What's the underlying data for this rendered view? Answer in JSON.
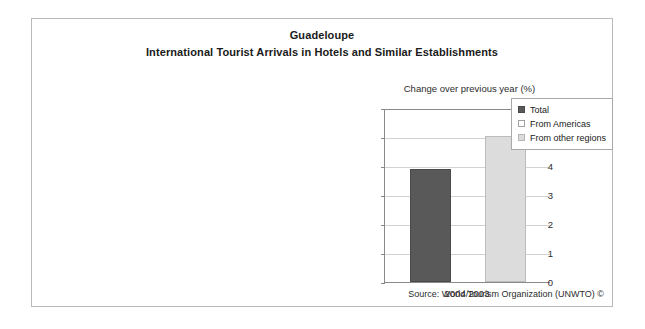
{
  "figure": {
    "title": "Guadeloupe",
    "subtitle": "International Tourist Arrivals in Hotels and Similar Establishments",
    "axis_note": "Change over previous year (%)",
    "source": "Source: World Tourism Organization (UNWTO) ©"
  },
  "colors": {
    "total": "#595959",
    "from_americas": "#ffffff",
    "from_other_regions": "#dcdcdc",
    "frame": "#b9b9b9",
    "axis": "#8a8a8a",
    "gridline": "#d2d2d2"
  },
  "legend": {
    "position": "top-right",
    "items": [
      {
        "label": "Total",
        "swatch": "total"
      },
      {
        "label": "From Americas",
        "swatch": "from_americas"
      },
      {
        "label": "From other regions",
        "swatch": "from_other_regions"
      }
    ]
  },
  "yaxis": {
    "ticks": [
      "0",
      "1",
      "2",
      "3",
      "4",
      "5",
      "6"
    ]
  },
  "chart_data": {
    "type": "bar",
    "subtitle": "Change over previous year (%)",
    "categories": [
      "2004/2003"
    ],
    "series": [
      {
        "name": "Total",
        "values": [
          3.9
        ]
      },
      {
        "name": "From Americas",
        "values": [
          null
        ]
      },
      {
        "name": "From other regions",
        "values": [
          5.05
        ]
      }
    ],
    "xlabel": "",
    "ylabel": "Change over previous year (%)",
    "ylim": [
      0,
      6
    ],
    "yticks": [
      0,
      1,
      2,
      3,
      4,
      5,
      6
    ],
    "grid": true,
    "legend_position": "top-right",
    "annotations": [
      "Source: World Tourism Organization (UNWTO) ©"
    ]
  }
}
